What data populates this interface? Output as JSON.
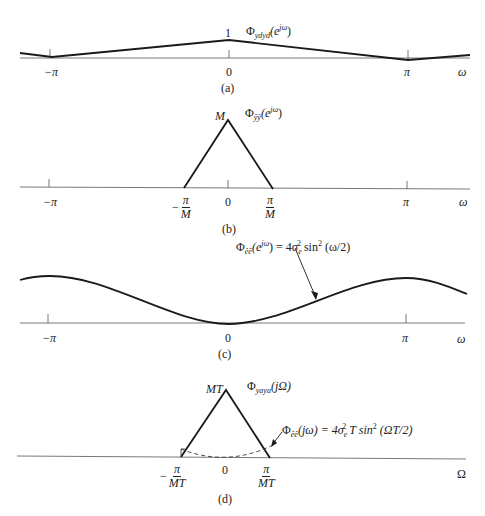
{
  "panels": {
    "a": {
      "caption": "(a)",
      "function_label": "Φ",
      "function_sub": "ydyd",
      "function_arg": "(e",
      "function_sup": "jω",
      "function_close": ")",
      "peak_label": "1",
      "ticks": [
        "−π",
        "0",
        "π"
      ],
      "axis_var": "ω"
    },
    "b": {
      "caption": "(b)",
      "function_label": "Φ",
      "function_sub": "ŷŷ",
      "function_arg": "(e",
      "function_sup": "jω",
      "function_close": ")",
      "peak_label": "M",
      "ticks": [
        "−π",
        "0",
        "π"
      ],
      "band_left_num": "π",
      "band_left_den": "M",
      "band_left_sign": "−",
      "band_right_num": "π",
      "band_right_den": "M",
      "axis_var": "ω"
    },
    "c": {
      "caption": "(c)",
      "function_label": "Φ",
      "function_sub": "êê",
      "function_arg": "(e",
      "function_sup": "jω",
      "function_rest": ") = 4σ",
      "sigma_sub": "e",
      "sigma_sup": "2",
      "sin_text": " sin",
      "sin_sup": "2",
      "sin_arg": " (ω/2)",
      "ticks": [
        "−π",
        "0",
        "π"
      ],
      "axis_var": "ω"
    },
    "d": {
      "caption": "(d)",
      "function_label": "Φ",
      "function_sub": "yaya",
      "function_arg": "(jΩ)",
      "peak_label": "MT",
      "noise_label": "Φ",
      "noise_sub": "êê",
      "noise_arg": "(jω) = 4σ",
      "sigma_sub": "e",
      "sigma_sup": "2",
      "noise_rest": " T sin",
      "sin_sup": "2",
      "sin_arg": " (ΩT/2)",
      "tick_zero": "0",
      "band_left_sign": "−",
      "band_left_num": "π",
      "band_left_den": "MT",
      "band_right_num": "π",
      "band_right_den": "MT",
      "axis_var": "Ω"
    }
  },
  "colors": {
    "curve": "#1a1a1a",
    "axis": "#333333",
    "text": "#222222"
  }
}
